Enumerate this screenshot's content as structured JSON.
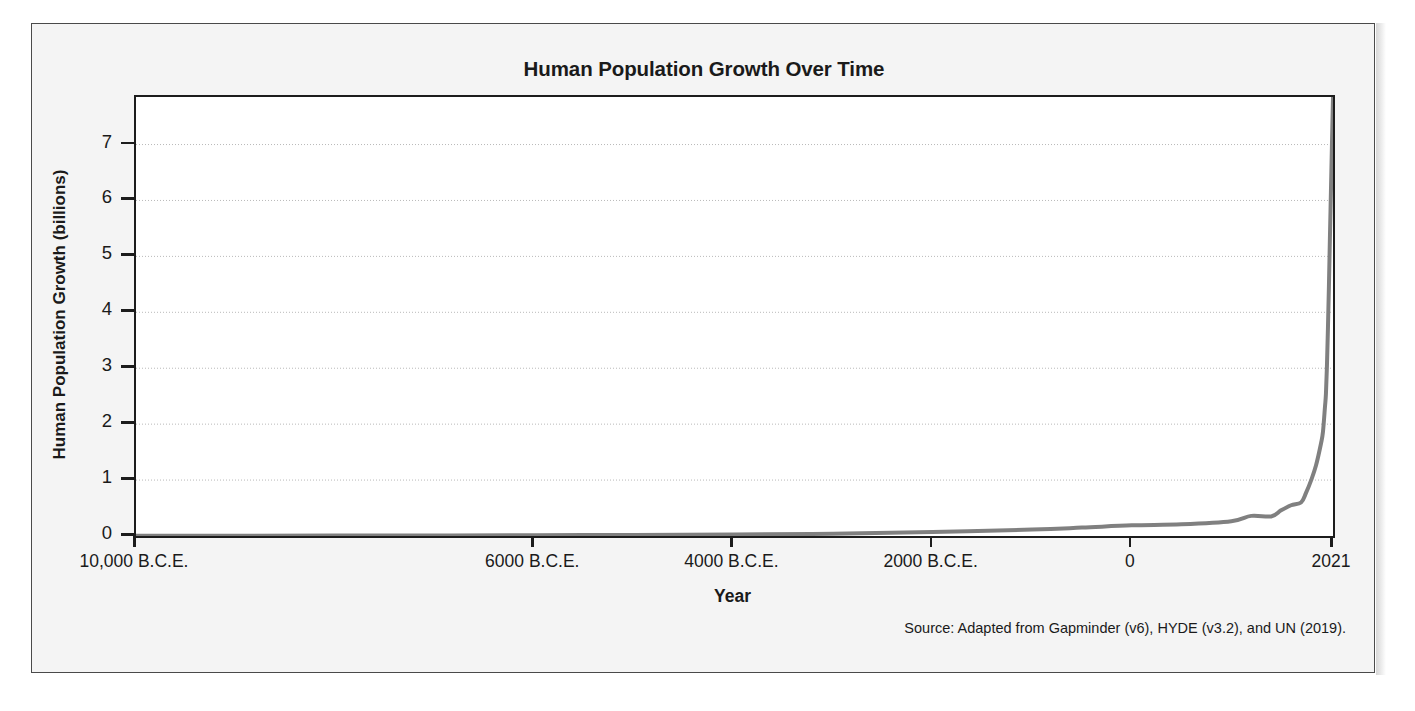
{
  "figure": {
    "title": "Human Population Growth Over Time",
    "source_note": "Source: Adapted from Gapminder (v6), HYDE (v3.2), and UN (2019).",
    "frame_color": "#4a4a4a",
    "background": "#f4f4f4"
  },
  "chart_data": {
    "type": "line",
    "title": "Human Population Growth Over Time",
    "xlabel": "Year",
    "ylabel": "Human Population Growth (billions)",
    "xlim": [
      -10000,
      2021
    ],
    "ylim": [
      0,
      7.85
    ],
    "grid": true,
    "legend": null,
    "line_color": "#808080",
    "line_width": 4,
    "x_tick_values": [
      -10000,
      -6000,
      -4000,
      -2000,
      0,
      2021
    ],
    "x_tick_labels": [
      "10,000 B.C.E.",
      "6000 B.C.E.",
      "4000 B.C.E.",
      "2000 B.C.E.",
      "0",
      "2021"
    ],
    "y_tick_values": [
      0,
      1,
      2,
      3,
      4,
      5,
      6,
      7
    ],
    "y_tick_labels": [
      "0",
      "1",
      "2",
      "3",
      "4",
      "5",
      "6",
      "7"
    ],
    "series": [
      {
        "name": "World population",
        "x": [
          -10000,
          -9000,
          -8000,
          -7000,
          -6000,
          -5000,
          -4000,
          -3000,
          -2000,
          -1000,
          -500,
          0,
          500,
          1000,
          1200,
          1400,
          1500,
          1600,
          1700,
          1750,
          1800,
          1850,
          1900,
          1920,
          1940,
          1950,
          1960,
          1970,
          1980,
          1990,
          2000,
          2010,
          2021
        ],
        "y": [
          0.004,
          0.005,
          0.007,
          0.01,
          0.014,
          0.02,
          0.028,
          0.04,
          0.072,
          0.115,
          0.15,
          0.19,
          0.21,
          0.265,
          0.36,
          0.35,
          0.46,
          0.55,
          0.6,
          0.77,
          0.99,
          1.26,
          1.65,
          1.86,
          2.3,
          2.54,
          3.03,
          3.7,
          4.46,
          5.33,
          6.14,
          6.96,
          7.84
        ]
      }
    ]
  },
  "axes": {
    "y_label": "Human Population Growth (billions)",
    "x_label": "Year"
  }
}
